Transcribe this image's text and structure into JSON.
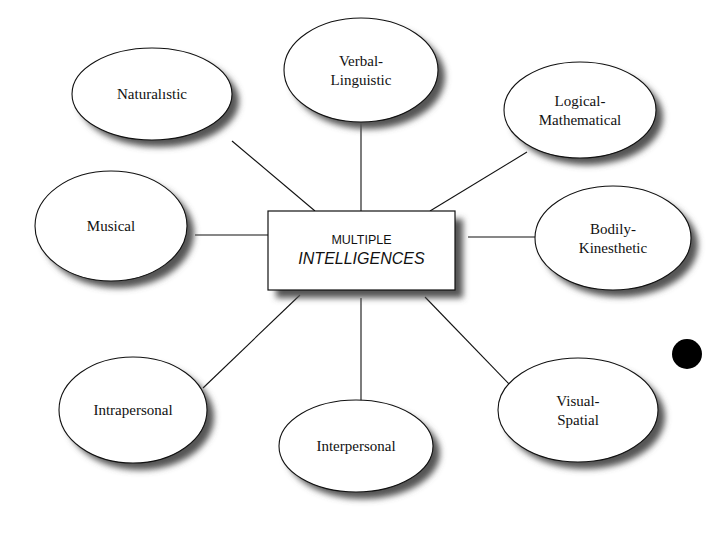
{
  "diagram": {
    "center": {
      "line1": "MULTIPLE",
      "line2": "INTELLIGENCES",
      "box": {
        "x": 268,
        "y": 211,
        "w": 187,
        "h": 79
      }
    },
    "nodes": [
      {
        "id": "naturalistic",
        "lines": [
          "Naturalıstic"
        ],
        "cx": 152,
        "cy": 94,
        "rx": 80,
        "ry": 46,
        "link": [
          232,
          141,
          315,
          211
        ]
      },
      {
        "id": "verbal-linguistic",
        "lines": [
          "Verbal-",
          "Linguistic"
        ],
        "cx": 361,
        "cy": 70,
        "rx": 77,
        "ry": 52,
        "link": [
          361,
          122,
          361,
          211
        ]
      },
      {
        "id": "logical-mathematical",
        "lines": [
          "Logical-",
          "Mathematical"
        ],
        "cx": 580,
        "cy": 110,
        "rx": 76,
        "ry": 48,
        "link": [
          527,
          152,
          430,
          211
        ]
      },
      {
        "id": "musical",
        "lines": [
          "Musical"
        ],
        "cx": 111,
        "cy": 226,
        "rx": 76,
        "ry": 55,
        "link": [
          195,
          235,
          268,
          235
        ]
      },
      {
        "id": "bodily-kinesthetic",
        "lines": [
          "Bodily-",
          "Kinesthetic"
        ],
        "cx": 613,
        "cy": 238,
        "rx": 78,
        "ry": 52,
        "link": [
          468,
          237,
          536,
          237
        ]
      },
      {
        "id": "intrapersonal",
        "lines": [
          "Intrapersonal"
        ],
        "cx": 133,
        "cy": 410,
        "rx": 74,
        "ry": 53,
        "link": [
          203,
          388,
          300,
          295
        ]
      },
      {
        "id": "interpersonal",
        "lines": [
          "Interpersonal"
        ],
        "cx": 356,
        "cy": 446,
        "rx": 77,
        "ry": 46,
        "link": [
          361,
          298,
          361,
          406
        ]
      },
      {
        "id": "visual-spatial",
        "lines": [
          "Visual-",
          "Spatial"
        ],
        "cx": 578,
        "cy": 410,
        "rx": 80,
        "ry": 52,
        "link": [
          425,
          297,
          512,
          387
        ]
      }
    ],
    "marker": {
      "cx": 687,
      "cy": 354,
      "r": 15,
      "color": "#000000"
    },
    "colors": {
      "stroke": "#111111",
      "shadow": "#555555",
      "fill": "#ffffff"
    }
  }
}
